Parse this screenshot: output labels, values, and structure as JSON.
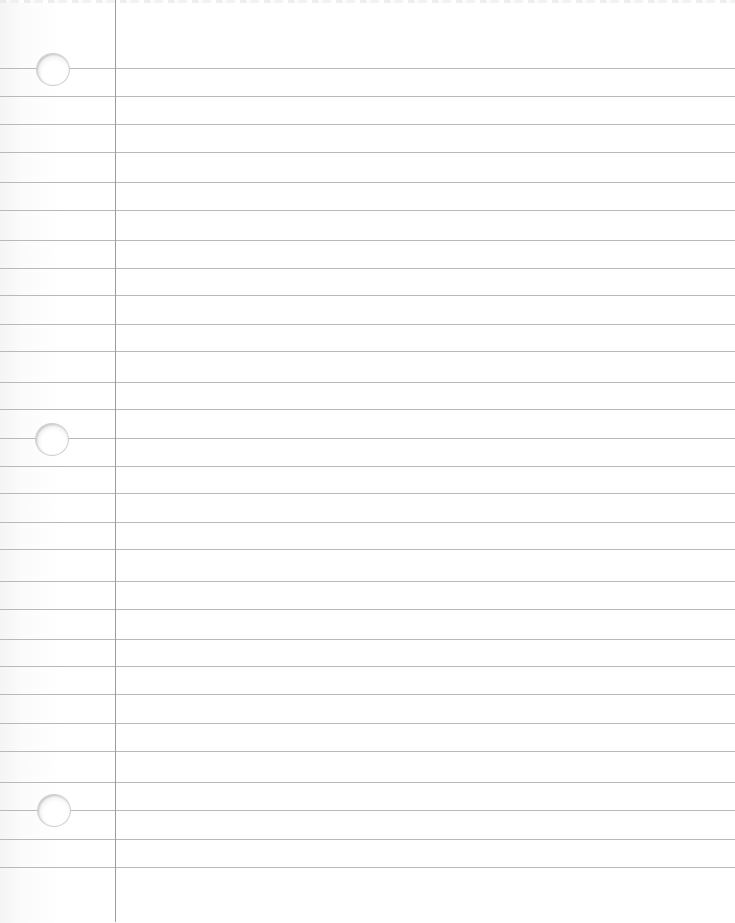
{
  "page": {
    "type": "lined-notebook-paper",
    "background_color": "#ffffff",
    "rule_color": "#b9b9b9",
    "margin_line_color": "#9c9c9c",
    "margin_line_x": 115,
    "rule_positions_y": [
      68,
      96,
      124,
      152,
      182,
      210,
      240,
      268,
      295,
      324,
      351,
      382,
      409,
      438,
      466,
      493,
      522,
      549,
      581,
      609,
      639,
      666,
      694,
      723,
      751,
      782,
      810,
      839,
      867
    ],
    "holes": [
      {
        "cx": 52,
        "cy": 69
      },
      {
        "cx": 51,
        "cy": 439
      },
      {
        "cx": 53,
        "cy": 810
      }
    ]
  }
}
